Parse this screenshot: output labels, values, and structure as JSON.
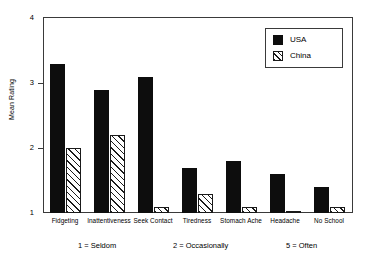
{
  "chart_data": {
    "type": "bar",
    "title": "",
    "xlabel": "",
    "ylabel": "Mean Rating",
    "ylim": [
      1,
      4
    ],
    "yticks": [
      1,
      2,
      3,
      4
    ],
    "ytick_labels": [
      "1",
      "2",
      "3",
      "4"
    ],
    "grid": false,
    "legend_position": "top-right",
    "categories": [
      "Fidgeting",
      "Inattentiveness",
      "Seek Contact",
      "Tiredness",
      "Stomach Ache",
      "Headache",
      "No School"
    ],
    "series": [
      {
        "name": "USA",
        "color": "#0d0d0d",
        "fill": "solid",
        "values": [
          3.3,
          2.9,
          3.1,
          1.7,
          1.8,
          1.6,
          1.4
        ]
      },
      {
        "name": "China",
        "color": "#ffffff",
        "fill": "diagonal-hatch",
        "values": [
          2.0,
          2.2,
          1.1,
          1.3,
          1.1,
          1.0,
          1.1
        ]
      }
    ],
    "annotations": [
      "1 = Seldom",
      "2 = Occasionally",
      "5 = Often"
    ]
  },
  "legend": {
    "entries": [
      {
        "label": "USA",
        "swatch": "solid-black-square-icon"
      },
      {
        "label": "China",
        "swatch": "hatched-square-icon"
      }
    ]
  }
}
